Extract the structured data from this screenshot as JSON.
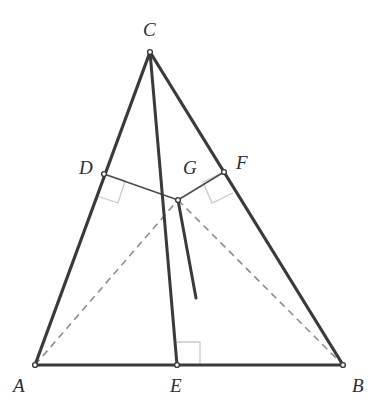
{
  "figure": {
    "name": "triangle-abc-with-cevians",
    "type": "euclidean-geometry-diagram",
    "width": 374,
    "height": 415,
    "background_color": "#ffffff",
    "stroke_color_heavy": "#3a3a3a",
    "stroke_color_thin": "#4a4a4a",
    "stroke_color_dashed": "#8d8d8d",
    "stroke_color_right_angle": "#c9c9c9"
  },
  "points": {
    "A": {
      "label": "A",
      "x": 35,
      "y": 365,
      "label_x": 13,
      "label_y": 376
    },
    "B": {
      "label": "B",
      "x": 343,
      "y": 365,
      "label_x": 352,
      "label_y": 376
    },
    "C": {
      "label": "C",
      "x": 150,
      "y": 52,
      "label_x": 143,
      "label_y": 20
    },
    "D": {
      "label": "D",
      "x": 104,
      "y": 174,
      "label_x": 79,
      "label_y": 158
    },
    "E": {
      "label": "E",
      "x": 177,
      "y": 365,
      "label_x": 170,
      "label_y": 376
    },
    "F": {
      "label": "F",
      "x": 224,
      "y": 172,
      "label_x": 236,
      "label_y": 153
    },
    "G": {
      "label": "G",
      "x": 178,
      "y": 200,
      "label_x": 183,
      "label_y": 158
    }
  },
  "segments": [
    {
      "name": "side-AC",
      "from": "A",
      "to": "C",
      "style": "solid",
      "weight": "heavy"
    },
    {
      "name": "side-CB",
      "from": "C",
      "to": "B",
      "style": "solid",
      "weight": "heavy"
    },
    {
      "name": "side-AB",
      "from": "A",
      "to": "B",
      "style": "solid",
      "weight": "heavy"
    },
    {
      "name": "cevian-CE",
      "from": "C",
      "to": "E",
      "style": "solid",
      "weight": "heavy"
    },
    {
      "name": "perpendicular-DG",
      "from": "D",
      "to": "G",
      "style": "solid",
      "weight": "thin"
    },
    {
      "name": "perpendicular-GF",
      "from": "G",
      "to": "F",
      "style": "solid",
      "weight": "thin"
    },
    {
      "name": "dashed-AG",
      "from": "A",
      "to": "G",
      "style": "dashed",
      "weight": "thin"
    },
    {
      "name": "dashed-GB",
      "from": "G",
      "to": "B",
      "style": "dashed",
      "weight": "thin"
    },
    {
      "name": "ray-from-G",
      "from": "G",
      "to": "ray-end",
      "style": "solid",
      "weight": "heavy",
      "x2": 196,
      "y2": 298
    }
  ],
  "right_angle_marks": [
    {
      "name": "right-angle-at-D",
      "vertex_x": 104,
      "vertex_y": 174,
      "size": 22,
      "along": "D-to-G",
      "toward": "D-to-A"
    },
    {
      "name": "right-angle-at-F",
      "vertex_x": 224,
      "vertex_y": 172,
      "size": 22,
      "along": "F-to-G",
      "toward": "F-to-B"
    },
    {
      "name": "right-angle-at-E",
      "vertex_x": 177,
      "vertex_y": 365,
      "size": 23,
      "along": "E-to-B",
      "toward": "E-to-C"
    }
  ],
  "labels": {
    "A": "A",
    "B": "B",
    "C": "C",
    "D": "D",
    "E": "E",
    "F": "F",
    "G": "G"
  }
}
